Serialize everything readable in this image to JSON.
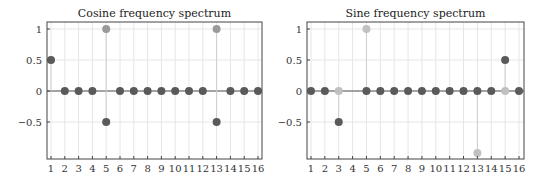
{
  "colors": {
    "dark_marker": "#5a5a5a",
    "medium_marker": "#9a9a9a",
    "light_marker": "#c0c0c0",
    "grid": "#e6e6e6",
    "frame": "#444444",
    "stem": "#cfcfcf"
  },
  "chart_data": [
    {
      "type": "scatter",
      "subtype": "stem",
      "title": "Cosine frequency spectrum",
      "xlabel": "",
      "ylabel": "",
      "x": [
        1,
        2,
        3,
        4,
        5,
        6,
        7,
        8,
        9,
        10,
        11,
        12,
        13,
        14,
        15,
        16
      ],
      "x_tick_labels": [
        "1",
        "2",
        "3",
        "4",
        "5",
        "6",
        "7",
        "8",
        "9",
        "10",
        "11",
        "12",
        "13",
        "14",
        "15",
        "16"
      ],
      "y_ticks": [
        1,
        0.5,
        0,
        -0.5
      ],
      "y_tick_labels": [
        "1",
        "0.5",
        "0",
        "−0.5"
      ],
      "ylim": [
        -1.1,
        1.1
      ],
      "grid": true,
      "series": [
        {
          "name": "spectrum-reference",
          "color": "medium",
          "values": [
            null,
            null,
            null,
            null,
            1,
            null,
            null,
            null,
            null,
            null,
            null,
            null,
            1,
            null,
            null,
            null
          ]
        },
        {
          "name": "spectrum",
          "color": "dark",
          "values": [
            0.5,
            0,
            0,
            0,
            -0.5,
            0,
            0,
            0,
            0,
            0,
            0,
            0,
            -0.5,
            0,
            0,
            0
          ]
        }
      ]
    },
    {
      "type": "scatter",
      "subtype": "stem",
      "title": "Sine frequency spectrum",
      "xlabel": "",
      "ylabel": "",
      "x": [
        1,
        2,
        3,
        4,
        5,
        6,
        7,
        8,
        9,
        10,
        11,
        12,
        13,
        14,
        15,
        16
      ],
      "x_tick_labels": [
        "1",
        "2",
        "3",
        "4",
        "5",
        "6",
        "7",
        "8",
        "9",
        "10",
        "11",
        "12",
        "13",
        "14",
        "15",
        "16"
      ],
      "y_ticks": [
        1,
        0.5,
        0,
        -0.5
      ],
      "y_tick_labels": [
        "1",
        "0.5",
        "0",
        "−0.5"
      ],
      "ylim": [
        -1.1,
        1.1
      ],
      "grid": true,
      "series": [
        {
          "name": "spectrum-reference",
          "color": "light",
          "values": [
            null,
            null,
            0,
            null,
            1,
            null,
            null,
            null,
            null,
            null,
            null,
            null,
            -1,
            null,
            0,
            null
          ]
        },
        {
          "name": "spectrum",
          "color": "dark",
          "values": [
            0,
            0,
            -0.5,
            null,
            0,
            0,
            0,
            0,
            0,
            0,
            0,
            0,
            0,
            0,
            0.5,
            0
          ]
        }
      ]
    }
  ],
  "panels": [
    {
      "title": "Cosine frequency spectrum"
    },
    {
      "title": "Sine frequency spectrum"
    }
  ]
}
